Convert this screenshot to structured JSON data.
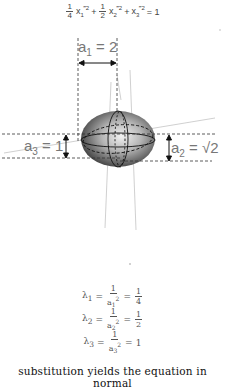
{
  "equation": {
    "term1_coef_num": "1",
    "term1_coef_den": "4",
    "term1_var": "x",
    "term1_sub": "1",
    "term1_sup": "‴2",
    "plus1": "+",
    "term2_coef_num": "1",
    "term2_coef_den": "2",
    "term2_var": "x",
    "term2_sub": "2",
    "term2_sup": "‴2",
    "plus2": "+",
    "term3_var": "x",
    "term3_sub": "3",
    "term3_sup": "‴2",
    "equals": "= 1"
  },
  "figure": {
    "a1_label": {
      "var": "a",
      "sub": "1",
      "rest": " = 2"
    },
    "a2_label": {
      "var": "a",
      "sub": "2",
      "rest": " = √2"
    },
    "a3_label": {
      "var": "a",
      "sub": "3",
      "rest": " = 1"
    },
    "colors": {
      "dashed": "#333333",
      "axis_line": "#bbbbbb",
      "ellipsoid_dark": "#3a3a3a",
      "ellipsoid_light": "#e8e8e8"
    }
  },
  "eigenvalues": [
    {
      "lambda": "λ",
      "sub": "1",
      "num": "1",
      "den_var": "a",
      "den_sub": "1",
      "den_sup": "2",
      "result": "1/4",
      "result_num": "1",
      "result_den": "4"
    },
    {
      "lambda": "λ",
      "sub": "2",
      "num": "1",
      "den_var": "a",
      "den_sub": "2",
      "den_sup": "2",
      "result": "1/2",
      "result_num": "1",
      "result_den": "2"
    },
    {
      "lambda": "λ",
      "sub": "3",
      "num": "1",
      "den_var": "a",
      "den_sub": "3",
      "den_sup": "2",
      "result": "1",
      "result_num": null,
      "result_den": null
    }
  ],
  "caption": "substitution yields the equation in normal"
}
